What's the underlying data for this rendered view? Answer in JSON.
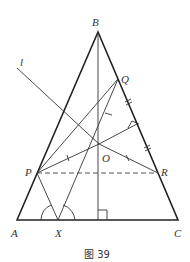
{
  "figure": {
    "caption": "图 39",
    "points": {
      "A": {
        "label": "A",
        "x": 17,
        "y": 220
      },
      "B": {
        "label": "B",
        "x": 98,
        "y": 32
      },
      "C": {
        "label": "C",
        "x": 178,
        "y": 220
      },
      "P": {
        "label": "P",
        "x": 37,
        "y": 173
      },
      "Q": {
        "label": "Q",
        "x": 118,
        "y": 79
      },
      "R": {
        "label": "R",
        "x": 158,
        "y": 173
      },
      "O": {
        "label": "O",
        "x": 99,
        "y": 144
      },
      "X": {
        "label": "X",
        "x": 58,
        "y": 220
      }
    },
    "line_label": "l",
    "markers": {
      "right_angles": [
        "altitude-foot",
        "O-to-BC"
      ],
      "equal_tick_single": [
        "PO",
        "OR",
        "QX-segment"
      ],
      "equal_tick_double": [
        "Q-side",
        "R-side"
      ],
      "angle_arcs": [
        "AXP",
        "PXC-side"
      ]
    }
  }
}
